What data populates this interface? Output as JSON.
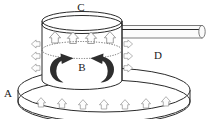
{
  "figure": {
    "background_color": "#ffffff",
    "line_color": "#2b2b2b",
    "arrow_outline_color": "#8a8a8a",
    "arrow_fill_color": "#fdfdfd",
    "swirl_color": "#2e2e2e",
    "dotted_color": "#6b6b6b",
    "width": 209,
    "height": 119
  },
  "labels": {
    "a": "A",
    "b": "B",
    "c": "C",
    "d": "D"
  },
  "components": {
    "base_disc": {
      "name": "A",
      "description": "lower flat cylindrical disc / heating plate"
    },
    "vessel": {
      "name": "B",
      "description": "central vertical cylinder with internal circulation"
    },
    "top_chamber": {
      "name": "C",
      "description": "upper region of cylinder with rising flow"
    },
    "outlet_pipe": {
      "name": "D",
      "description": "horizontal tube exiting to the right"
    }
  },
  "arrows": {
    "base_up": {
      "count": 7,
      "direction": "up",
      "style": "hollow"
    },
    "chamber_up": {
      "count": 4,
      "direction": "up",
      "style": "hollow"
    },
    "left_out": {
      "count": 3,
      "direction": "left",
      "style": "hollow"
    },
    "right_out": {
      "count": 3,
      "direction": "right",
      "style": "hollow"
    },
    "circulation": {
      "count": 2,
      "direction": "inward-curl",
      "style": "solid"
    }
  }
}
